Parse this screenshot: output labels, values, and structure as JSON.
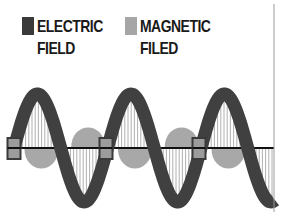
{
  "legend": {
    "electric": {
      "line1": "ELECTRIC",
      "line2": "FIELD",
      "color": "#3a3a3a"
    },
    "magnetic": {
      "line1": "MAGNETIC",
      "line2": "FILED",
      "color": "#a6a6a6"
    }
  },
  "diagram": {
    "axis_y": 148,
    "axis_color": "#111111",
    "wave_color": "#404040",
    "wave_amplitude": 54,
    "wave_period": 93.5,
    "wave_start_x": 14,
    "wave_end_x": 275,
    "hatch_color": "#9a9a9a",
    "magnetic_color": "#a8a8a8",
    "node_positions_x": [
      14,
      106,
      199
    ],
    "boundary_line_x": 274
  }
}
